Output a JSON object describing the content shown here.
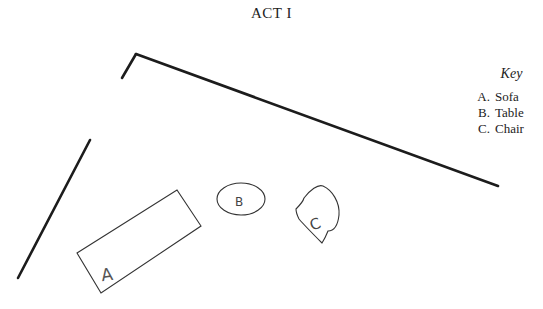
{
  "title": "ACT I",
  "key": {
    "title": "Key",
    "items": [
      {
        "letter": "A.",
        "label": "Sofa"
      },
      {
        "letter": "B.",
        "label": "Table"
      },
      {
        "letter": "C.",
        "label": "Chair"
      }
    ]
  },
  "stage": {
    "walls": [
      {
        "name": "short-wall",
        "points": "122,78 136,54"
      },
      {
        "name": "back-wall",
        "points": "136,54 498,186"
      },
      {
        "name": "left-wall",
        "points": "90,140 18,278"
      }
    ],
    "furniture": {
      "sofa": {
        "label": "A",
        "points": "77,253 177,190 201,226 101,293"
      },
      "table": {
        "label": "B",
        "cx": 241,
        "cy": 199,
        "rx": 24,
        "ry": 16
      },
      "chair": {
        "label": "C",
        "path": "M296,209 C300,205 303,202 304,198 C310,190 318,184 323,186 C332,190 340,202 339,215 C338,224 335,231 328,231 C326,236 324,240 322,243 C315,236 305,226 299,219 C297,215 296,212 296,209 Z"
      }
    },
    "colors": {
      "wall": "#1c1c1c",
      "furniture": "#333333"
    }
  }
}
